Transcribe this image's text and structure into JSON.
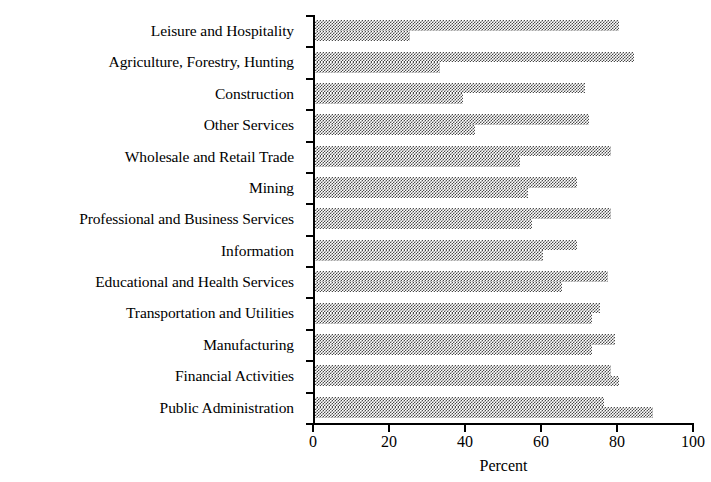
{
  "chart_data": {
    "type": "bar",
    "orientation": "horizontal",
    "title": "",
    "subtitle": "",
    "xlabel": "Percent",
    "ylabel": "",
    "xlim": [
      0,
      100
    ],
    "xticks": [
      0,
      20,
      40,
      60,
      80,
      100
    ],
    "xticklabels": [
      "0",
      "20",
      "40",
      "60",
      "80",
      "100"
    ],
    "grid": false,
    "legend": "none",
    "legend_entries": [],
    "categories": [
      "Leisure and Hospitality",
      "Agriculture, Forestry, Hunting",
      "Construction",
      "Other Services",
      "Wholesale and Retail Trade",
      "Mining",
      "Professional and Business Services",
      "Information",
      "Educational and Health Services",
      "Transportation and Utilities",
      "Manufacturing",
      "Financial Activities",
      "Public Administration"
    ],
    "series": [
      {
        "name": "series-upper",
        "values": [
          80,
          84,
          71,
          72,
          78,
          69,
          78,
          69,
          77,
          75,
          79,
          78,
          76
        ]
      },
      {
        "name": "series-lower",
        "values": [
          25,
          33,
          39,
          42,
          54,
          56,
          57,
          60,
          65,
          73,
          73,
          80,
          89
        ]
      }
    ]
  },
  "axis": {
    "x_title": "Percent"
  }
}
